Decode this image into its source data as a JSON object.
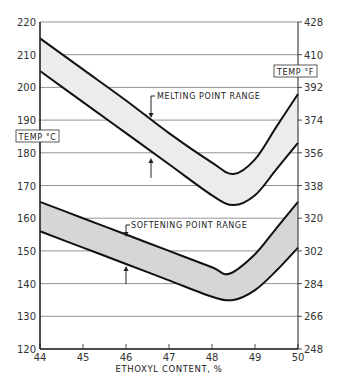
{
  "chart_data": {
    "type": "area",
    "title": "",
    "xlabel": "ETHOXYL CONTENT, %",
    "ylabel": "TEMP °C",
    "ylabel_right": "TEMP °F",
    "xlim": [
      44,
      50
    ],
    "ylim": [
      120,
      220
    ],
    "ylim_right": [
      248,
      428
    ],
    "grid": true,
    "x_ticks": [
      "44",
      "45",
      "46",
      "47",
      "48",
      "49",
      "50"
    ],
    "y_ticks_left": [
      "120",
      "130",
      "140",
      "150",
      "160",
      "170",
      "180",
      "190",
      "200",
      "210",
      "220"
    ],
    "y_ticks_right": [
      "248",
      "266",
      "284",
      "302",
      "320",
      "338",
      "356",
      "374",
      "392",
      "410",
      "428"
    ],
    "annotations": [
      "MELTING POINT RANGE",
      "SOFTENING POINT RANGE"
    ],
    "series": [
      {
        "name": "Melting point range (upper)",
        "x": [
          44,
          45,
          46,
          47,
          48,
          48.5,
          49,
          49.5,
          50
        ],
        "values": [
          215,
          205.5,
          196,
          186,
          177,
          173.5,
          178,
          188,
          198
        ]
      },
      {
        "name": "Melting point range (lower)",
        "x": [
          44,
          45,
          46,
          47,
          48,
          48.5,
          49,
          49.5,
          50
        ],
        "values": [
          205,
          195.5,
          186,
          176.5,
          167,
          164,
          167,
          175,
          183
        ]
      },
      {
        "name": "Softening point range (upper)",
        "x": [
          44,
          45,
          46,
          47,
          48,
          48.4,
          49,
          49.5,
          50
        ],
        "values": [
          165,
          160,
          155,
          150,
          145,
          143,
          149,
          157,
          165
        ]
      },
      {
        "name": "Softening point range (lower)",
        "x": [
          44,
          45,
          46,
          47,
          48,
          48.5,
          49,
          49.5,
          50
        ],
        "values": [
          156,
          151,
          146,
          141,
          136,
          135,
          138,
          144,
          151
        ]
      }
    ]
  },
  "labels": {
    "temp_c": "TEMP °C",
    "temp_f": "TEMP °F",
    "melting": "MELTING POINT RANGE",
    "softening": "SOFTENING POINT RANGE",
    "xtitle": "ETHOXYL CONTENT, %"
  }
}
